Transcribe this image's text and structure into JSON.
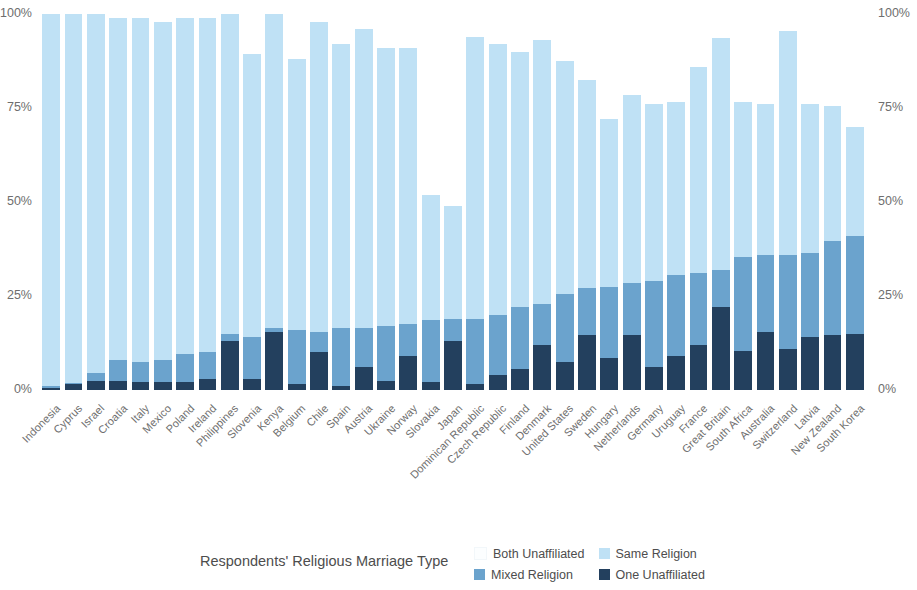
{
  "chart_data": {
    "type": "bar",
    "title": "",
    "subtitle": "",
    "xlabel": "",
    "ylabel": "",
    "ylim": [
      0,
      100
    ],
    "y_ticks": [
      "0%",
      "25%",
      "50%",
      "75%",
      "100%"
    ],
    "y_tick_values": [
      0,
      25,
      50,
      75,
      100
    ],
    "grid": false,
    "stacked": true,
    "legend_position": "bottom",
    "legend_title": "Respondents' Religious Marriage Type",
    "axis_duplicated_right": true,
    "colors": {
      "same_religion": "#bfe1f5",
      "mixed_religion": "#6ba3cd",
      "one_unaffiliated": "#23405e",
      "both_unaffiliated": "#fcfeff"
    },
    "series": [
      {
        "name": "One Unaffiliated",
        "key": "one_unaffiliated",
        "color": "#23405e",
        "values": [
          0.5,
          1.5,
          2.5,
          2.5,
          2.0,
          2.0,
          2.0,
          3.0,
          13.0,
          3.0,
          15.5,
          1.5,
          10.0,
          1.0,
          6.0,
          2.5,
          9.0,
          2.0,
          13.0,
          1.5,
          4.0,
          5.5,
          12.0,
          7.5,
          14.5,
          8.5,
          14.5,
          6.0,
          9.0,
          12.0,
          22.0,
          10.5,
          15.5,
          11.0,
          14.0,
          14.5,
          15.0
        ]
      },
      {
        "name": "Mixed Religion",
        "key": "mixed_religion",
        "color": "#6ba3cd",
        "values": [
          0.5,
          0.5,
          2.0,
          5.5,
          5.5,
          6.0,
          7.5,
          7.0,
          2.0,
          11.0,
          1.0,
          14.5,
          5.5,
          15.5,
          10.5,
          14.5,
          8.5,
          16.5,
          6.0,
          17.5,
          16.0,
          16.5,
          11.0,
          18.0,
          12.5,
          19.0,
          14.0,
          23.0,
          21.5,
          19.0,
          10.0,
          25.0,
          20.5,
          25.0,
          22.5,
          25.0,
          26.0
        ]
      },
      {
        "name": "Same Religion",
        "key": "same_religion",
        "color": "#bfe1f5",
        "values": [
          99.0,
          98.0,
          95.5,
          91.0,
          91.5,
          90.0,
          89.5,
          89.0,
          85.0,
          75.5,
          83.5,
          72.0,
          82.5,
          75.5,
          79.5,
          74.0,
          73.5,
          33.5,
          30.0,
          75.0,
          72.0,
          68.0,
          70.0,
          62.0,
          55.5,
          44.5,
          50.0,
          47.0,
          46.0,
          55.0,
          61.5,
          41.0,
          40.0,
          59.5,
          39.5,
          36.0,
          29.0
        ]
      },
      {
        "name": "Both Unaffiliated",
        "key": "both_unaffiliated",
        "color": "#fcfeff",
        "values": [
          0,
          0,
          0,
          0,
          0,
          0,
          0,
          0,
          0,
          0,
          0,
          0,
          0,
          0,
          0,
          0,
          0,
          0,
          0,
          0,
          0,
          0,
          0,
          0,
          0,
          0,
          0,
          0,
          0,
          0,
          0,
          0,
          0,
          0,
          0,
          0,
          0
        ]
      }
    ],
    "categories": [
      "Indonesia",
      "Cyprus",
      "Israel",
      "Croatia",
      "Italy",
      "Mexico",
      "Poland",
      "Ireland",
      "Philippines",
      "Slovenia",
      "Kenya",
      "Belgium",
      "Chile",
      "Spain",
      "Austria",
      "Ukraine",
      "Norway",
      "Slovakia",
      "Japan",
      "Dominican Republic",
      "Czech Republic",
      "Finland",
      "Denmark",
      "United States",
      "Sweden",
      "Hungary",
      "Netherlands",
      "Germany",
      "Uruguay",
      "France",
      "Great Britain",
      "South Africa",
      "Australia",
      "Switzerland",
      "Latvia",
      "New Zealand",
      "South Korea"
    ],
    "totals": [
      100,
      100,
      100,
      99,
      99,
      98,
      99,
      99,
      100,
      89.5,
      100,
      88,
      98,
      92,
      96,
      91,
      91,
      52,
      49,
      94,
      92,
      90,
      93,
      87.5,
      82.5,
      72,
      78.5,
      76,
      76.5,
      86,
      93.5,
      76.5,
      76,
      95.5,
      76,
      75.5,
      70
    ]
  },
  "legend": {
    "title": "Respondents' Religious Marriage Type",
    "items": [
      {
        "label": "Both Unaffiliated",
        "swatch": "both"
      },
      {
        "label": "Same Religion",
        "swatch": "same"
      },
      {
        "label": "Mixed Religion",
        "swatch": "mixed"
      },
      {
        "label": "One Unaffiliated",
        "swatch": "one"
      }
    ]
  }
}
